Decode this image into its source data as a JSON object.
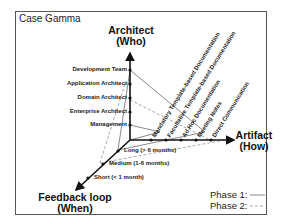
{
  "title": "Case Gamma",
  "axes": {
    "architect": {
      "line1": "Architect",
      "line2": "(Who)"
    },
    "artifact": {
      "line1": "Artifact",
      "line2": "(How)"
    },
    "feedback": {
      "line1": "Feedback loop",
      "line2": "(When)"
    }
  },
  "architect_ticks": [
    "Development Team",
    "Application Architect",
    "Domain Architect",
    "Enterprise Architect",
    "Management"
  ],
  "artifact_ticks": [
    "Mandatory Template-based Documentation",
    "Facultative Template-based Documentation",
    "Ad Hoc Documentation",
    "Meeting Notes",
    "Direct Communication"
  ],
  "feedback_ticks": [
    "Long (> 6 months)",
    "Medium (1-6 months)",
    "Short (< 1 month)"
  ],
  "legend": {
    "phase1": "Phase 1:",
    "phase2": "Phase 2:"
  },
  "colors": {
    "axis": "#111111",
    "phase1": "#888888",
    "phase2": "#aaaaaa"
  }
}
